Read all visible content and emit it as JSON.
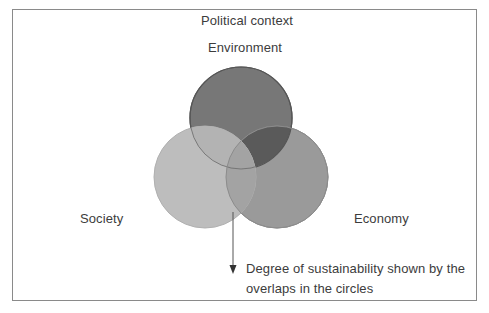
{
  "diagram": {
    "title": "Political context",
    "circles": [
      {
        "id": "environment",
        "label": "Environment",
        "fill": "#777777"
      },
      {
        "id": "society",
        "label": "Society",
        "fill": "#bdbdbd"
      },
      {
        "id": "economy",
        "label": "Economy",
        "fill": "#9a9a9a"
      }
    ],
    "overlap_colors": {
      "environment_economy": "#5a5a5a",
      "environment_society": "#b3b3b3",
      "society_economy": "#a3a3a3"
    },
    "annotation": {
      "text": "Degree of sustainability shown by the overlaps in the circles",
      "line1": "Degree of sustainability shown by the",
      "line2": "overlaps in the circles"
    },
    "colors": {
      "border": "#8a8a8a",
      "text": "#3c3c3c",
      "outline": "#5a5a5a",
      "arrow": "#555555"
    }
  }
}
